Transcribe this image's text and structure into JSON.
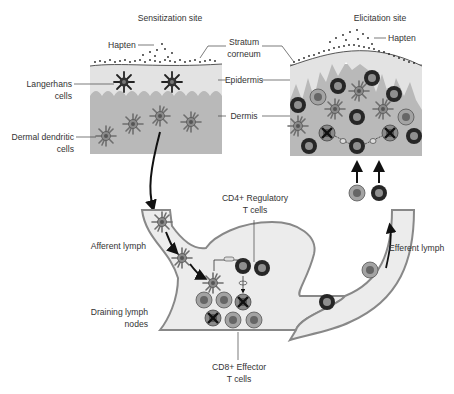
{
  "titles": {
    "sensitization": "Sensitization site",
    "elicitation": "Elicitation site"
  },
  "labels": {
    "hapten_left": "Hapten",
    "hapten_right": "Hapten",
    "stratum_corneum_1": "Stratum",
    "stratum_corneum_2": "corneum",
    "epidermis": "Epidermis",
    "dermis": "Dermis",
    "langerhans_1": "Langerhans",
    "langerhans_2": "cells",
    "dermal_dc_1": "Dermal dendritic",
    "dermal_dc_2": "cells",
    "afferent_lymph": "Afferent lymph",
    "efferent_lymph": "Efferent lymph",
    "draining_1": "Draining lymph",
    "draining_2": "nodes",
    "cd4_1": "CD4+ Regulatory",
    "cd4_2": "T cells",
    "cd8_1": "CD8+ Effector",
    "cd8_2": "T cells"
  },
  "colors": {
    "epidermis": "#e3e3e3",
    "dermis": "#b9b9b9",
    "lymph_fill": "#ececec",
    "dendritic": "#6e6e6e",
    "cd8_cell": "#9a9a9a",
    "cd4_cell": "#2e2e2e",
    "line": "#333333"
  }
}
